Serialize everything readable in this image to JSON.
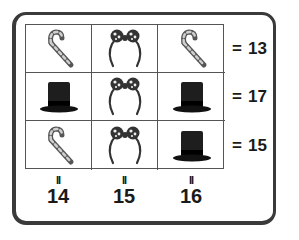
{
  "puzzle": {
    "rows": [
      {
        "cells": [
          "candy-cane",
          "headband",
          "candy-cane"
        ],
        "sum_label": "=",
        "sum": "13"
      },
      {
        "cells": [
          "top-hat",
          "headband",
          "top-hat"
        ],
        "sum_label": "=",
        "sum": "17"
      },
      {
        "cells": [
          "candy-cane",
          "headband",
          "top-hat"
        ],
        "sum_label": "=",
        "sum": "15"
      }
    ],
    "columns": [
      {
        "sum_label": "II",
        "sum": "14"
      },
      {
        "sum_label": "II",
        "sum": "15"
      },
      {
        "sum_label": "II",
        "sum": "16"
      }
    ]
  },
  "icons": {
    "candy-cane": "candy-cane-icon",
    "headband": "bow-headband-icon",
    "top-hat": "top-hat-icon"
  },
  "colors": {
    "frame": "#3a3a3a",
    "grid_line": "#555555",
    "text": "#1a1a1a",
    "hat": "#1e1e1e",
    "cane_stripe": "#6b6b6b"
  }
}
